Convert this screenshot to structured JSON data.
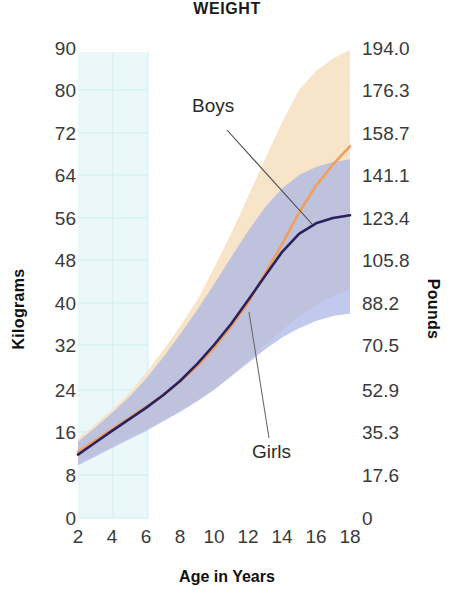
{
  "chart_data": {
    "type": "line",
    "title": "WEIGHT",
    "xlabel": "Age in Years",
    "ylabel": "Kilograms",
    "ylabel_right": "Pounds",
    "xlim": [
      2,
      18
    ],
    "ylim": [
      0,
      90
    ],
    "grid": true,
    "legend_position": "inline-annotations",
    "x_ticks": [
      "2",
      "4",
      "6",
      "8",
      "10",
      "12",
      "14",
      "16",
      "18"
    ],
    "y_ticks_left": [
      "90",
      "80",
      "72",
      "64",
      "56",
      "48",
      "40",
      "32",
      "24",
      "16",
      "8",
      "0"
    ],
    "y_ticks_right": [
      "194.0",
      "176.3",
      "158.7",
      "141.1",
      "123.4",
      "105.8",
      "88.2",
      "70.5",
      "52.9",
      "35.3",
      "17.6",
      "0"
    ],
    "annotations": [
      {
        "text": "Boys",
        "series": "boys"
      },
      {
        "text": "Girls",
        "series": "girls"
      }
    ],
    "x": [
      2,
      3,
      4,
      5,
      6,
      7,
      8,
      9,
      10,
      11,
      12,
      13,
      14,
      15,
      16,
      17,
      18
    ],
    "series": [
      {
        "name": "Boys",
        "color": "#F0A05A",
        "values": [
          12.3,
          14.4,
          16.5,
          18.6,
          20.8,
          23.0,
          25.5,
          28.2,
          31.5,
          35.5,
          40.0,
          45.5,
          51.0,
          57.0,
          62.0,
          66.0,
          69.5
        ],
        "band_color": "#F7E0C0",
        "band_upper": [
          14.8,
          17.4,
          20.2,
          23.4,
          27.0,
          31.0,
          35.5,
          40.5,
          46.5,
          53.0,
          60.0,
          67.0,
          74.0,
          80.0,
          84.5,
          87.5,
          89.5
        ],
        "band_lower": [
          10.2,
          11.8,
          13.4,
          15.0,
          16.6,
          18.2,
          20.0,
          22.0,
          24.2,
          26.6,
          29.2,
          32.0,
          34.8,
          37.4,
          39.6,
          41.3,
          42.4
        ]
      },
      {
        "name": "Girls",
        "color": "#2B2160",
        "values": [
          11.8,
          14.0,
          16.2,
          18.4,
          20.6,
          23.0,
          25.6,
          28.6,
          32.0,
          36.0,
          40.5,
          45.0,
          49.5,
          53.0,
          55.0,
          56.0,
          56.5
        ],
        "band_color": "#A9B4E4",
        "band_upper": [
          14.2,
          16.8,
          19.6,
          22.6,
          26.0,
          29.8,
          34.0,
          38.6,
          43.5,
          48.5,
          53.5,
          58.0,
          61.5,
          64.0,
          65.5,
          66.5,
          67.0
        ],
        "band_lower": [
          9.8,
          11.4,
          13.0,
          14.6,
          16.2,
          18.0,
          19.8,
          21.8,
          24.0,
          26.4,
          28.8,
          31.2,
          33.4,
          35.2,
          36.6,
          37.5,
          38.0
        ]
      }
    ]
  },
  "chart": {
    "title": "WEIGHT",
    "xlabel": "Age in Years",
    "ylabel_left": "Kilograms",
    "ylabel_right": "Pounds",
    "annotation_boys": "Boys",
    "annotation_girls": "Girls",
    "x_ticks": [
      "2",
      "4",
      "6",
      "8",
      "10",
      "12",
      "14",
      "16",
      "18"
    ],
    "y_ticks_left": [
      "90",
      "80",
      "72",
      "64",
      "56",
      "48",
      "40",
      "32",
      "24",
      "16",
      "8",
      "0"
    ],
    "y_ticks_right": [
      "194.0",
      "176.3",
      "158.7",
      "141.1",
      "123.4",
      "105.8",
      "88.2",
      "70.5",
      "52.9",
      "35.3",
      "17.6",
      "0"
    ],
    "colors": {
      "boys_line": "#F0A05A",
      "girls_line": "#2B2160",
      "boys_band": "#F7E0C0",
      "girls_band": "#A9B4E4",
      "grid_tint": "#E7F6F8"
    }
  }
}
